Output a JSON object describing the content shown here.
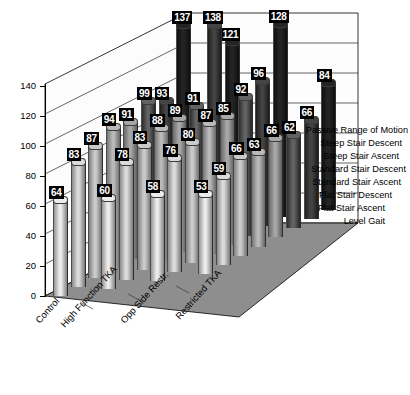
{
  "chart_data": {
    "type": "bar",
    "title": "",
    "subtitle": "",
    "xlabel": "",
    "ylabel": "",
    "ylim": [
      0,
      140
    ],
    "ytick_step": 20,
    "yticks": [
      0,
      20,
      40,
      60,
      80,
      100,
      120,
      140
    ],
    "grid": true,
    "legend_position": "right-depth-axis",
    "projection": "3d",
    "categories": [
      "Control",
      "High Function TKA",
      "Opp Side Restr.",
      "Restricted TKA"
    ],
    "depth_categories": [
      "Level Gait",
      "Flat Stair Ascent",
      "Flat Stair Descent",
      "Standard Stair Ascent",
      "Standard Stair Descent",
      "Steep Stair Ascent",
      "Steep Stair Descent",
      "Passive Range of Motion"
    ],
    "series": [
      {
        "name": "Level Gait",
        "values": [
          64,
          60,
          58,
          53
        ]
      },
      {
        "name": "Flat Stair Ascent",
        "values": [
          83,
          78,
          76,
          59
        ]
      },
      {
        "name": "Flat Stair Descent",
        "values": [
          87,
          83,
          80,
          66
        ]
      },
      {
        "name": "Standard Stair Ascent",
        "values": [
          94,
          88,
          87,
          63
        ]
      },
      {
        "name": "Standard Stair Descent",
        "values": [
          91,
          89,
          85,
          66
        ]
      },
      {
        "name": "Steep Stair Ascent",
        "values": [
          99,
          91,
          92,
          62
        ]
      },
      {
        "name": "Steep Stair Descent",
        "values": [
          93,
          138,
          96,
          66
        ]
      },
      {
        "name": "Passive Range of Motion",
        "values": [
          137,
          121,
          128,
          84
        ]
      }
    ],
    "colors": {
      "bar_front_light": "#dcdcdc",
      "bar_mid": "#9a9a9a",
      "bar_dark": "#2a2a2a",
      "floor": "#8e8e8e",
      "wall": "#f7f7f7",
      "label_bg": "#000000",
      "label_fg": "#ffffff",
      "axis": "#000000"
    }
  }
}
